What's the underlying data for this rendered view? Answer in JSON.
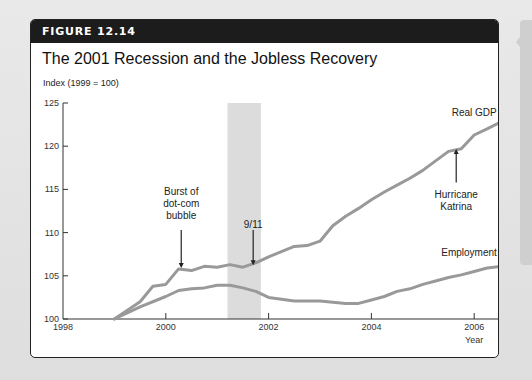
{
  "figure": {
    "label": "FIGURE 12.14",
    "title": "The 2001 Recession and the Jobless Recovery"
  },
  "chart_data": {
    "type": "line",
    "title": "The 2001 Recession and the Jobless Recovery",
    "xlabel": "Year",
    "ylabel": "Index (1999 = 100)",
    "xlim": [
      1998,
      2006.6
    ],
    "ylim": [
      100,
      125
    ],
    "x_ticks": [
      "1998",
      "2000",
      "2002",
      "2004",
      "2006"
    ],
    "y_ticks": [
      "100",
      "105",
      "110",
      "115",
      "120",
      "125"
    ],
    "grid": false,
    "shaded_regions": [
      {
        "label": "2001 recession",
        "start": 2001.2,
        "end": 2001.85,
        "color": "#dcdcdc"
      }
    ],
    "series": [
      {
        "name": "Real GDP",
        "color": "#999999",
        "x": [
          1999.0,
          1999.5,
          1999.75,
          2000.0,
          2000.25,
          2000.5,
          2000.75,
          2001.0,
          2001.25,
          2001.5,
          2001.75,
          2002.0,
          2002.25,
          2002.5,
          2002.75,
          2003.0,
          2003.25,
          2003.5,
          2003.75,
          2004.0,
          2004.25,
          2004.5,
          2004.75,
          2005.0,
          2005.25,
          2005.5,
          2005.75,
          2006.0,
          2006.25,
          2006.55
        ],
        "values": [
          100.0,
          102.0,
          103.8,
          104.0,
          105.8,
          105.6,
          106.1,
          106.0,
          106.3,
          106.0,
          106.5,
          107.2,
          107.8,
          108.4,
          108.5,
          109.0,
          110.8,
          111.9,
          112.8,
          113.8,
          114.7,
          115.5,
          116.3,
          117.2,
          118.3,
          119.4,
          119.7,
          121.3,
          122.0,
          122.9
        ]
      },
      {
        "name": "Employment",
        "color": "#999999",
        "x": [
          1999.0,
          1999.5,
          2000.0,
          2000.25,
          2000.5,
          2000.75,
          2001.0,
          2001.25,
          2001.5,
          2001.75,
          2002.0,
          2002.5,
          2003.0,
          2003.5,
          2003.75,
          2004.0,
          2004.25,
          2004.5,
          2004.75,
          2005.0,
          2005.25,
          2005.5,
          2005.75,
          2006.0,
          2006.25,
          2006.55
        ],
        "values": [
          100.0,
          101.4,
          102.6,
          103.3,
          103.5,
          103.6,
          103.9,
          103.9,
          103.6,
          103.2,
          102.5,
          102.1,
          102.1,
          101.8,
          101.8,
          102.2,
          102.6,
          103.2,
          103.5,
          104.0,
          104.4,
          104.8,
          105.1,
          105.5,
          105.9,
          106.1
        ]
      }
    ],
    "annotations": [
      {
        "text": [
          "Burst of",
          "dot-com",
          "bubble"
        ],
        "x": 2000.3,
        "arrow_to_y": 105.8
      },
      {
        "text": [
          "9/11"
        ],
        "x": 2001.7,
        "arrow_to_y": 106.1
      },
      {
        "text": [
          "Hurricane",
          "Katrina"
        ],
        "x": 2005.65,
        "arrow_to_y": 119.8
      },
      {
        "text": [
          "Real GDP"
        ],
        "x": 2006.0,
        "y": 123.5
      },
      {
        "text": [
          "Employment"
        ],
        "x": 2005.9,
        "y": 107.3
      }
    ]
  }
}
